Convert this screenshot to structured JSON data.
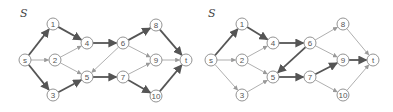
{
  "graphs": [
    {
      "label": "S",
      "label_pos": [
        20,
        17
      ],
      "nodes": [
        {
          "id": "s",
          "label": "s",
          "x": 25,
          "y": 60
        },
        {
          "id": "1",
          "label": "1",
          "x": 53,
          "y": 24
        },
        {
          "id": "2",
          "label": "2",
          "x": 55,
          "y": 60
        },
        {
          "id": "3",
          "label": "3",
          "x": 53,
          "y": 95
        },
        {
          "id": "4",
          "label": "4",
          "x": 87,
          "y": 43
        },
        {
          "id": "5",
          "label": "5",
          "x": 87,
          "y": 77
        },
        {
          "id": "6",
          "label": "6",
          "x": 123,
          "y": 43
        },
        {
          "id": "7",
          "label": "7",
          "x": 123,
          "y": 77
        },
        {
          "id": "8",
          "label": "8",
          "x": 156,
          "y": 25
        },
        {
          "id": "9",
          "label": "9",
          "x": 156,
          "y": 60
        },
        {
          "id": "10",
          "label": "10",
          "x": 156,
          "y": 96
        },
        {
          "id": "t",
          "label": "t",
          "x": 186,
          "y": 60
        }
      ],
      "edges": [
        {
          "from": "s",
          "to": "1",
          "bold": true
        },
        {
          "from": "s",
          "to": "2",
          "bold": false
        },
        {
          "from": "s",
          "to": "3",
          "bold": true
        },
        {
          "from": "1",
          "to": "4",
          "bold": true
        },
        {
          "from": "2",
          "to": "4",
          "bold": false
        },
        {
          "from": "2",
          "to": "5",
          "bold": false
        },
        {
          "from": "3",
          "to": "5",
          "bold": true
        },
        {
          "from": "4",
          "to": "6",
          "bold": true
        },
        {
          "from": "6",
          "to": "5",
          "bold": false
        },
        {
          "from": "5",
          "to": "7",
          "bold": true
        },
        {
          "from": "6",
          "to": "8",
          "bold": true
        },
        {
          "from": "6",
          "to": "9",
          "bold": false
        },
        {
          "from": "7",
          "to": "9",
          "bold": false
        },
        {
          "from": "7",
          "to": "10",
          "bold": true
        },
        {
          "from": "8",
          "to": "t",
          "bold": true
        },
        {
          "from": "9",
          "to": "t",
          "bold": false
        },
        {
          "from": "10",
          "to": "t",
          "bold": true
        }
      ]
    },
    {
      "label": "S",
      "label_pos": [
        208,
        17
      ],
      "nodes": [
        {
          "id": "s",
          "label": "s",
          "x": 211,
          "y": 60
        },
        {
          "id": "1",
          "label": "1",
          "x": 242,
          "y": 24
        },
        {
          "id": "2",
          "label": "2",
          "x": 242,
          "y": 60
        },
        {
          "id": "3",
          "label": "3",
          "x": 242,
          "y": 95
        },
        {
          "id": "4",
          "label": "4",
          "x": 273,
          "y": 43
        },
        {
          "id": "5",
          "label": "5",
          "x": 273,
          "y": 77
        },
        {
          "id": "6",
          "label": "6",
          "x": 310,
          "y": 43
        },
        {
          "id": "7",
          "label": "7",
          "x": 310,
          "y": 77
        },
        {
          "id": "8",
          "label": "8",
          "x": 343,
          "y": 24
        },
        {
          "id": "9",
          "label": "9",
          "x": 343,
          "y": 60
        },
        {
          "id": "10",
          "label": "10",
          "x": 343,
          "y": 95
        },
        {
          "id": "t",
          "label": "t",
          "x": 373,
          "y": 60
        }
      ],
      "edges": [
        {
          "from": "s",
          "to": "1",
          "bold": true
        },
        {
          "from": "s",
          "to": "2",
          "bold": false
        },
        {
          "from": "s",
          "to": "3",
          "bold": false
        },
        {
          "from": "1",
          "to": "4",
          "bold": true
        },
        {
          "from": "2",
          "to": "4",
          "bold": false
        },
        {
          "from": "2",
          "to": "5",
          "bold": false
        },
        {
          "from": "3",
          "to": "5",
          "bold": false
        },
        {
          "from": "4",
          "to": "6",
          "bold": true
        },
        {
          "from": "6",
          "to": "5",
          "bold": true
        },
        {
          "from": "5",
          "to": "7",
          "bold": true
        },
        {
          "from": "6",
          "to": "8",
          "bold": false
        },
        {
          "from": "6",
          "to": "9",
          "bold": false
        },
        {
          "from": "7",
          "to": "9",
          "bold": true
        },
        {
          "from": "7",
          "to": "10",
          "bold": false
        },
        {
          "from": "8",
          "to": "t",
          "bold": false
        },
        {
          "from": "9",
          "to": "t",
          "bold": true
        },
        {
          "from": "10",
          "to": "t",
          "bold": false
        }
      ]
    }
  ],
  "style": {
    "bold_color": "#555555",
    "thin_color": "#9a9a9a",
    "node_radius": 6
  }
}
